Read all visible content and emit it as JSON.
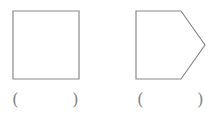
{
  "shapes": [
    {
      "name": "square",
      "points": "13,11 79,11 79,79 13,79"
    },
    {
      "name": "pentagon",
      "points": "136,11 181,11 205,45 181,79 136,79"
    }
  ],
  "answers": [
    {
      "open": "(",
      "close": ")",
      "value": ""
    },
    {
      "open": "(",
      "close": ")",
      "value": ""
    }
  ],
  "colors": {
    "stroke": "#8a8a8a"
  }
}
